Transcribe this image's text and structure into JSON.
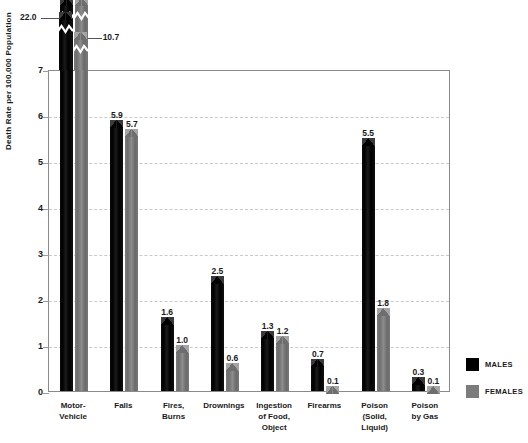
{
  "chart_data": {
    "type": "bar",
    "title": "",
    "xlabel": "",
    "ylabel": "Death Rate per 100,000 Population",
    "ylim": [
      0,
      7
    ],
    "yticks": [
      0,
      1,
      2,
      3,
      4,
      5,
      6,
      7
    ],
    "ytick_labels": [
      "0",
      "1",
      "2",
      "3",
      "4",
      "5",
      "6",
      "7"
    ],
    "grid": true,
    "grid_style": "dashed horizontal",
    "legend_position": "right",
    "axis_break": {
      "present": true,
      "note": "Two tallest bars are broken; true values annotated above the axis maximum of 7",
      "broken_bars": [
        {
          "category": "Motor-Vehicle",
          "series": "MALES",
          "value": 22.0,
          "label": "22.0"
        },
        {
          "category": "Motor-Vehicle",
          "series": "FEMALES",
          "value": 10.7,
          "label": "10.7"
        }
      ]
    },
    "categories": [
      "Motor-Vehicle",
      "Falls",
      "Fires, Burns",
      "Drownings",
      "Ingestion of Food, Object",
      "Firearms",
      "Poison (Solid, Liquid)",
      "Poison by Gas"
    ],
    "category_label_lines": [
      [
        "Motor-",
        "Vehicle"
      ],
      [
        "Falls"
      ],
      [
        "Fires,",
        "Burns"
      ],
      [
        "Drownings"
      ],
      [
        "Ingestion",
        "of Food,",
        "Object"
      ],
      [
        "Firearms"
      ],
      [
        "Poison",
        "(Solid,",
        "Liquid)"
      ],
      [
        "Poison",
        "by Gas"
      ]
    ],
    "series": [
      {
        "name": "MALES",
        "color": "#000000",
        "values": [
          22.0,
          5.9,
          1.6,
          2.5,
          1.3,
          0.7,
          5.5,
          0.3
        ],
        "value_labels": [
          "22.0",
          "5.9",
          "1.6",
          "2.5",
          "1.3",
          "0.7",
          "5.5",
          "0.3"
        ]
      },
      {
        "name": "FEMALES",
        "color": "#7c7c7c",
        "values": [
          10.7,
          5.7,
          1.0,
          0.6,
          1.2,
          0.1,
          1.8,
          0.1
        ],
        "value_labels": [
          "10.7",
          "5.7",
          "1.0",
          "0.6",
          "1.2",
          "0.1",
          "1.8",
          "0.1"
        ]
      }
    ]
  },
  "legend": {
    "items": [
      {
        "label": "MALES",
        "color": "#000000"
      },
      {
        "label": "FEMALES",
        "color": "#7c7c7c"
      }
    ]
  }
}
